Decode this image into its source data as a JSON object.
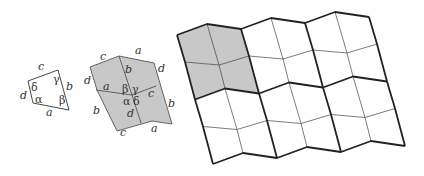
{
  "figure": {
    "panels": [
      {
        "id": "single-quad",
        "description": "Single quadrilateral tile with sides and angles labeled",
        "side_labels": [
          "a",
          "b",
          "c",
          "d"
        ],
        "angle_labels": [
          "α",
          "β",
          "γ",
          "δ"
        ]
      },
      {
        "id": "four-quad-patch",
        "description": "Four copies of the quadrilateral meeting at a vertex with angles α, β, γ, δ",
        "side_labels": [
          "a",
          "a",
          "a",
          "a",
          "b",
          "b",
          "b",
          "b",
          "c",
          "c",
          "c",
          "c",
          "d",
          "d",
          "d",
          "d"
        ],
        "angle_labels": [
          "β",
          "γ",
          "α",
          "δ"
        ]
      },
      {
        "id": "tiling",
        "description": "Periodic tiling of the plane by the quadrilateral; shaded 2x2 fundamental block",
        "blocks_x": 3,
        "blocks_y": 2
      }
    ],
    "colors": {
      "shade": "#c8c8c8",
      "line": "#333333",
      "background": "#ffffff"
    },
    "labels": {
      "p1": {
        "a": "a",
        "b": "b",
        "c": "c",
        "d": "d",
        "alpha": "α",
        "beta": "β",
        "gamma": "γ",
        "delta": "δ"
      },
      "p2": {
        "a_top": "a",
        "a_left": "a",
        "a_bottom": "a",
        "b_top": "b",
        "b_right": "b",
        "b_left": "b",
        "c_top": "c",
        "c_right": "c",
        "c_bottom": "c",
        "d_left": "d",
        "d_right": "d",
        "d_center": "d",
        "alpha": "α",
        "beta": "β",
        "gamma": "γ",
        "delta": "δ"
      }
    }
  }
}
